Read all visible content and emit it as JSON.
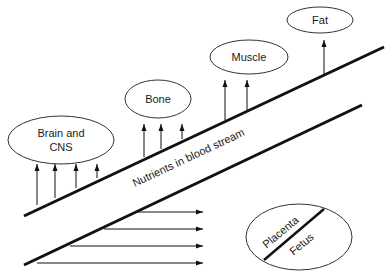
{
  "diagram": {
    "channel": {
      "label": "Nutrients in blood stream",
      "upper_line": [
        24,
        216,
        384,
        47
      ],
      "lower_line": [
        24,
        265,
        362,
        105
      ],
      "color": "#111111"
    },
    "tissues": [
      {
        "id": "brain",
        "label_line1": "Brain and",
        "label_line2": "CNS",
        "cx": 61,
        "cy": 140,
        "rx": 53,
        "ry": 24,
        "arrow_count": 4
      },
      {
        "id": "bone",
        "label": "Bone",
        "cx": 158,
        "cy": 99,
        "rx": 33,
        "ry": 19,
        "arrow_count": 3
      },
      {
        "id": "muscle",
        "label": "Muscle",
        "cx": 249,
        "cy": 57,
        "rx": 39,
        "ry": 17,
        "arrow_count": 2
      },
      {
        "id": "fat",
        "label": "Fat",
        "cx": 320,
        "cy": 20,
        "rx": 33,
        "ry": 13,
        "arrow_count": 1
      }
    ],
    "placenta": {
      "label_top": "Placenta",
      "label_bottom": "Fetus",
      "cx": 299,
      "cy": 237,
      "rx": 53,
      "ry": 33
    },
    "horizontal_arrows": {
      "count": 4,
      "target": "placenta"
    },
    "stroke_color": "#111111",
    "outline_color": "#333333"
  }
}
